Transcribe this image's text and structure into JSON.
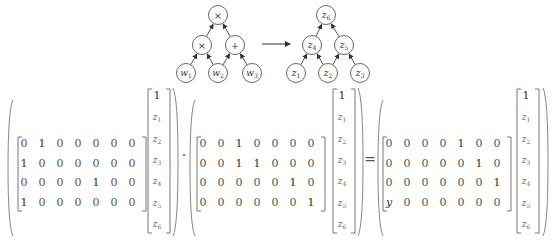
{
  "diagram": {
    "left_tree": {
      "nodes": [
        {
          "id": "root",
          "label": "×",
          "x": 218,
          "y": 15
        },
        {
          "id": "mul",
          "label": "×",
          "x": 202,
          "y": 45
        },
        {
          "id": "add",
          "label": "+",
          "x": 235,
          "y": 45
        },
        {
          "id": "w1",
          "label": "w",
          "sub": "1",
          "x": 186,
          "y": 73
        },
        {
          "id": "w2",
          "label": "w",
          "sub": "2",
          "x": 218,
          "y": 73
        },
        {
          "id": "w3",
          "label": "w",
          "sub": "3",
          "x": 252,
          "y": 73
        }
      ],
      "edges": [
        [
          "w1",
          "mul"
        ],
        [
          "w2",
          "mul"
        ],
        [
          "w2",
          "add"
        ],
        [
          "w3",
          "add"
        ],
        [
          "mul",
          "root"
        ],
        [
          "add",
          "root"
        ]
      ]
    },
    "arrow": {
      "from": "left_tree",
      "to": "right_tree"
    },
    "right_tree": {
      "nodes": [
        {
          "id": "z6",
          "label": "z",
          "sub": "6",
          "x": 326,
          "y": 15
        },
        {
          "id": "z4",
          "label": "z",
          "sub": "4",
          "x": 312,
          "y": 45
        },
        {
          "id": "z5",
          "label": "z",
          "sub": "5",
          "x": 344,
          "y": 45
        },
        {
          "id": "z1",
          "label": "z",
          "sub": "1",
          "x": 296,
          "y": 73
        },
        {
          "id": "z2",
          "label": "z",
          "sub": "2",
          "x": 328,
          "y": 73
        },
        {
          "id": "z3",
          "label": "z",
          "sub": "3",
          "x": 360,
          "y": 73
        }
      ],
      "edges": [
        [
          "z1",
          "z4"
        ],
        [
          "z2",
          "z4"
        ],
        [
          "z2",
          "z5"
        ],
        [
          "z3",
          "z5"
        ],
        [
          "z4",
          "z6"
        ],
        [
          "z5",
          "z6"
        ]
      ]
    }
  },
  "equation": {
    "operators": [
      "·",
      "="
    ],
    "vector": [
      "1",
      "z1",
      "z2",
      "z3",
      "z4",
      "z5",
      "z6"
    ],
    "vector_labels": [
      {
        "base": "1",
        "sub": ""
      },
      {
        "base": "z",
        "sub": "1"
      },
      {
        "base": "z",
        "sub": "2"
      },
      {
        "base": "z",
        "sub": "3"
      },
      {
        "base": "z",
        "sub": "4"
      },
      {
        "base": "z",
        "sub": "5"
      },
      {
        "base": "z",
        "sub": "6"
      }
    ],
    "matrices": [
      {
        "name": "A",
        "rows": [
          [
            "0",
            "1",
            "0",
            "0",
            "0",
            "0",
            "0"
          ],
          [
            "1",
            "0",
            "0",
            "0",
            "0",
            "0",
            "0"
          ],
          [
            "0",
            "0",
            "0",
            "0",
            "1",
            "0",
            "0"
          ],
          [
            "1",
            "0",
            "0",
            "0",
            "0",
            "0",
            "0"
          ]
        ]
      },
      {
        "name": "B",
        "rows": [
          [
            "0",
            "0",
            "1",
            "0",
            "0",
            "0",
            "0"
          ],
          [
            "0",
            "0",
            "1",
            "1",
            "0",
            "0",
            "0"
          ],
          [
            "0",
            "0",
            "0",
            "0",
            "0",
            "1",
            "0"
          ],
          [
            "0",
            "0",
            "0",
            "0",
            "0",
            "0",
            "1"
          ]
        ]
      },
      {
        "name": "C",
        "rows": [
          [
            "0",
            "0",
            "0",
            "0",
            "1",
            "0",
            "0"
          ],
          [
            "0",
            "0",
            "0",
            "0",
            "0",
            "1",
            "0"
          ],
          [
            "0",
            "0",
            "0",
            "0",
            "0",
            "0",
            "1"
          ],
          [
            "y",
            "0",
            "0",
            "0",
            "0",
            "0",
            "0"
          ]
        ]
      }
    ]
  }
}
